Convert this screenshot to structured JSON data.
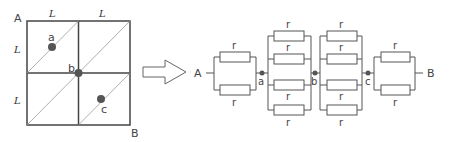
{
  "grid": {
    "corner_labels": {
      "A": "A",
      "B": "B"
    },
    "side_labels": {
      "top_left": "L",
      "top_right": "L",
      "left_top": "L",
      "left_bottom": "L"
    },
    "nodes": {
      "a": "a",
      "b": "b",
      "c": "c"
    }
  },
  "circuit": {
    "terminal_A": "A",
    "terminal_B": "B",
    "resistor_label": "r",
    "nodes": {
      "a": "a",
      "b": "b",
      "c": "c"
    },
    "blocks": [
      {
        "name": "A-a",
        "resistors": 2
      },
      {
        "name": "a-b",
        "resistors": 4
      },
      {
        "name": "b-c",
        "resistors": 4
      },
      {
        "name": "c-B",
        "resistors": 2
      }
    ]
  },
  "colors": {
    "line": "#555555",
    "dot": "#555555",
    "text": "#444444"
  }
}
